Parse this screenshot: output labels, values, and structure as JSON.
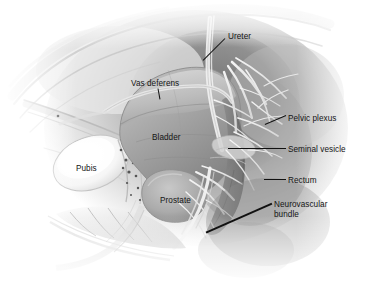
{
  "figure": {
    "kind": "medical-illustration",
    "view": "sagittal-section",
    "background_color": "#ffffff",
    "ink_color": "#151515",
    "palette": {
      "bone_light": "#fbfbfb",
      "tissue_mid": "#b9b9b9",
      "tissue_dark": "#8d8d8d",
      "cavity_shadow": "#6f6f6f",
      "nerve_light": "#ededed",
      "organ_bladder": "#a2a2a2",
      "organ_prostate": "#adadad"
    }
  },
  "labels": [
    {
      "id": "ureter",
      "text": "Ureter",
      "x": 228,
      "y": 32,
      "align": "left"
    },
    {
      "id": "vas-deferens",
      "text": "Vas deferens",
      "x": 131,
      "y": 79,
      "align": "left"
    },
    {
      "id": "pelvic-plexus",
      "text": "Pelvic plexus",
      "x": 288,
      "y": 114,
      "align": "left"
    },
    {
      "id": "bladder",
      "text": "Bladder",
      "x": 152,
      "y": 133,
      "align": "left"
    },
    {
      "id": "seminal-vesicle",
      "text": "Seminal vesicle",
      "x": 288,
      "y": 145,
      "align": "left"
    },
    {
      "id": "pubis",
      "text": "Pubis",
      "x": 76,
      "y": 164,
      "align": "left"
    },
    {
      "id": "rectum",
      "text": "Rectum",
      "x": 288,
      "y": 176,
      "align": "left"
    },
    {
      "id": "prostate",
      "text": "Prostate",
      "x": 160,
      "y": 196,
      "align": "left"
    },
    {
      "id": "neurovascular-bundle",
      "text": "Neurovascular bundle",
      "x": 274,
      "y": 200,
      "align": "left"
    }
  ],
  "leader_lines": [
    {
      "id": "ureter-leader",
      "x1": 225,
      "y1": 38,
      "x2": 203,
      "y2": 60,
      "width": 1.0
    },
    {
      "id": "vas-deferens-leader",
      "x1": 158,
      "y1": 88,
      "x2": 160,
      "y2": 99,
      "width": 1.0
    },
    {
      "id": "pelvic-plexus-leader",
      "x1": 286,
      "y1": 115,
      "x2": 265,
      "y2": 124,
      "width": 1.0
    },
    {
      "id": "seminal-vesicle-leader",
      "x1": 286,
      "y1": 148,
      "x2": 228,
      "y2": 148,
      "width": 1.0
    },
    {
      "id": "rectum-leader",
      "x1": 286,
      "y1": 179,
      "x2": 264,
      "y2": 179,
      "width": 1.0
    },
    {
      "id": "neurovascular-bundle-leader",
      "x1": 272,
      "y1": 203,
      "x2": 206,
      "y2": 232,
      "width": 1.6
    }
  ],
  "anatomy_regions": [
    {
      "id": "abdominal-wall",
      "name": "anterior abdominal wall"
    },
    {
      "id": "pubic-bone",
      "name": "pubic bone"
    },
    {
      "id": "bladder-dome",
      "name": "urinary bladder"
    },
    {
      "id": "prostate-gland",
      "name": "prostate gland"
    },
    {
      "id": "rectum-wall",
      "name": "rectum"
    },
    {
      "id": "sacrum",
      "name": "sacrum and coccyx"
    },
    {
      "id": "nerve-plexus",
      "name": "pelvic nerve plexus"
    },
    {
      "id": "ureter-tube",
      "name": "ureter"
    },
    {
      "id": "vas-deferens-tube",
      "name": "vas deferens"
    },
    {
      "id": "seminal-vesicles",
      "name": "seminal vesicles"
    }
  ]
}
